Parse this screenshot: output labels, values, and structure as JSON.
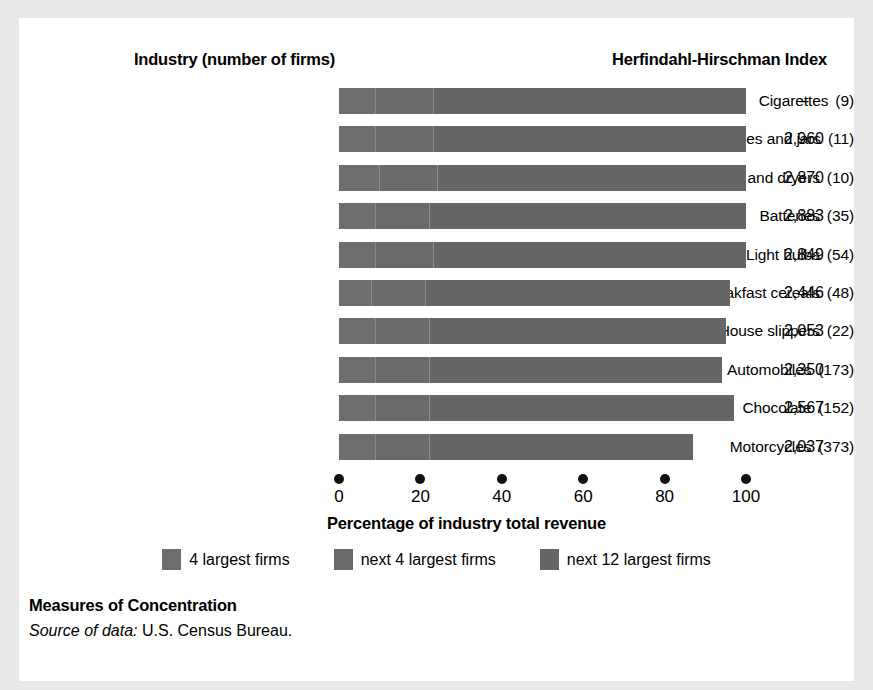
{
  "headers": {
    "industry": "Industry (number of firms)",
    "hhi": "Herfindahl-Hirschman Index"
  },
  "axis": {
    "title": "Percentage of industry total revenue",
    "ticks": [
      "0",
      "20",
      "40",
      "60",
      "80",
      "100"
    ],
    "min": 0,
    "max": 100
  },
  "legend": [
    {
      "label": "4 largest firms",
      "color": "#6e6e6e"
    },
    {
      "label": "next 4 largest firms",
      "color": "#6a6a6a"
    },
    {
      "label": "next 12 largest firms",
      "color": "#666666"
    }
  ],
  "caption": {
    "title": "Measures of Concentration",
    "source_prefix": "Source of data:",
    "source_text": " U.S. Census Bureau."
  },
  "chart_data": {
    "type": "bar",
    "orientation": "horizontal",
    "stacked": true,
    "title": "Measures of Concentration",
    "xlabel": "Percentage of industry total revenue",
    "ylabel": "Industry (number of firms)",
    "xlim": [
      0,
      100
    ],
    "xticks": [
      0,
      20,
      40,
      60,
      80,
      100
    ],
    "grid": false,
    "legend_position": "bottom",
    "series": [
      {
        "name": "4 largest firms",
        "values": [
          9,
          9,
          10,
          9,
          9,
          8,
          9,
          9,
          9,
          9
        ]
      },
      {
        "name": "next 4 largest firms",
        "values": [
          14,
          14,
          14,
          13,
          14,
          13,
          13,
          13,
          13,
          13
        ]
      },
      {
        "name": "next 12 largest firms",
        "values": [
          77,
          77,
          76,
          78,
          77,
          75,
          73,
          72,
          75,
          65
        ]
      }
    ],
    "categories": [
      "Cigarettes (9)",
      "Glass bottles and jars (11)",
      "Washing machines and dryers (10)",
      "Batteries (35)",
      "Light bulbs (54)",
      "Breakfast cereals (48)",
      "House slippers (22)",
      "Automobiles (173)",
      "Chocolate (152)",
      "Motorcycles (373)"
    ],
    "rows": [
      {
        "industry": "Cigarettes",
        "firms": "(9)",
        "hhi": "–",
        "seg1": 9,
        "seg2": 14,
        "seg3": 77,
        "total": 100
      },
      {
        "industry": "Glass bottles and jars",
        "firms": "(11)",
        "hhi": "2,960",
        "seg1": 9,
        "seg2": 14,
        "seg3": 77,
        "total": 100
      },
      {
        "industry": "Washing machines and dryers",
        "firms": "(10)",
        "hhi": "2,870",
        "seg1": 10,
        "seg2": 14,
        "seg3": 76,
        "total": 100
      },
      {
        "industry": "Batteries",
        "firms": "(35)",
        "hhi": "2,883",
        "seg1": 9,
        "seg2": 13,
        "seg3": 78,
        "total": 100
      },
      {
        "industry": "Light bulbs",
        "firms": "(54)",
        "hhi": "2,849",
        "seg1": 9,
        "seg2": 14,
        "seg3": 77,
        "total": 100
      },
      {
        "industry": "Breakfast cereals",
        "firms": "(48)",
        "hhi": "2,446",
        "seg1": 8,
        "seg2": 13,
        "seg3": 75,
        "total": 96
      },
      {
        "industry": "House slippers",
        "firms": "(22)",
        "hhi": "2,053",
        "seg1": 9,
        "seg2": 13,
        "seg3": 73,
        "total": 95
      },
      {
        "industry": "Automobiles",
        "firms": "(173)",
        "hhi": "2,350",
        "seg1": 9,
        "seg2": 13,
        "seg3": 72,
        "total": 94
      },
      {
        "industry": "Chocolate",
        "firms": "(152)",
        "hhi": "2,567",
        "seg1": 9,
        "seg2": 13,
        "seg3": 75,
        "total": 97
      },
      {
        "industry": "Motorcycles",
        "firms": "(373)",
        "hhi": "2,037",
        "seg1": 9,
        "seg2": 13,
        "seg3": 65,
        "total": 87
      }
    ]
  }
}
